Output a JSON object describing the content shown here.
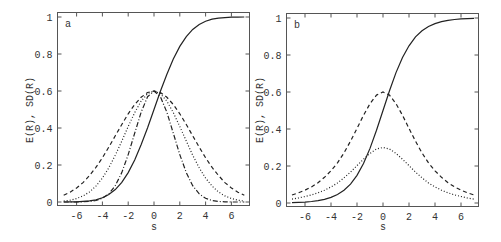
{
  "chart_data": [
    {
      "panel": "a",
      "type": "line",
      "title": "",
      "panel_label": "a",
      "xlabel": "s",
      "ylabel": "E(R), SD(R)",
      "xlim": [
        -7.5,
        7.5
      ],
      "ylim": [
        -0.025,
        1.025
      ],
      "xticks": [
        -6,
        -4,
        -2,
        0,
        2,
        4,
        6
      ],
      "xtick_labels": [
        "-6",
        "-4",
        "-2",
        "0",
        "2",
        "4",
        "6"
      ],
      "yticks": [
        0,
        0.2,
        0.4,
        0.6,
        0.8,
        1
      ],
      "ytick_labels": [
        "0",
        "0.2",
        "0.4",
        "0.6",
        "0.8",
        "1"
      ],
      "grid": false,
      "legend": null,
      "x": [
        -7,
        -6.5,
        -6,
        -5.5,
        -5,
        -4.5,
        -4,
        -3.5,
        -3,
        -2.5,
        -2,
        -1.5,
        -1,
        -0.5,
        0,
        0.5,
        1,
        1.5,
        2,
        2.5,
        3,
        3.5,
        4,
        4.5,
        5,
        5.5,
        6,
        6.5,
        7
      ],
      "series": [
        {
          "name": "E(R)",
          "style": "solid",
          "values": [
            0.0,
            0.001,
            0.001,
            0.003,
            0.006,
            0.012,
            0.023,
            0.04,
            0.067,
            0.106,
            0.159,
            0.227,
            0.309,
            0.401,
            0.5,
            0.599,
            0.691,
            0.773,
            0.841,
            0.894,
            0.933,
            0.96,
            0.977,
            0.988,
            0.994,
            0.997,
            0.999,
            0.999,
            1.0
          ]
        },
        {
          "name": "SD(R) wide",
          "style": "dashed",
          "values": [
            0.036,
            0.053,
            0.076,
            0.105,
            0.143,
            0.187,
            0.239,
            0.297,
            0.358,
            0.419,
            0.477,
            0.527,
            0.566,
            0.592,
            0.6,
            0.592,
            0.566,
            0.527,
            0.477,
            0.419,
            0.358,
            0.297,
            0.239,
            0.187,
            0.143,
            0.105,
            0.076,
            0.053,
            0.036
          ]
        },
        {
          "name": "SD(R) medium",
          "style": "dotted",
          "values": [
            0.005,
            0.01,
            0.019,
            0.033,
            0.054,
            0.086,
            0.129,
            0.185,
            0.253,
            0.329,
            0.408,
            0.483,
            0.545,
            0.586,
            0.6,
            0.586,
            0.545,
            0.483,
            0.408,
            0.329,
            0.253,
            0.185,
            0.129,
            0.086,
            0.054,
            0.033,
            0.019,
            0.01,
            0.005
          ]
        },
        {
          "name": "SD(R) narrow",
          "style": "dashdot",
          "values": [
            0.0,
            0.0,
            0.0,
            0.001,
            0.003,
            0.008,
            0.02,
            0.044,
            0.088,
            0.159,
            0.256,
            0.372,
            0.485,
            0.569,
            0.6,
            0.569,
            0.485,
            0.372,
            0.256,
            0.159,
            0.088,
            0.044,
            0.02,
            0.008,
            0.003,
            0.001,
            0.0,
            0.0,
            0.0
          ]
        }
      ]
    },
    {
      "panel": "b",
      "type": "line",
      "title": "",
      "panel_label": "b",
      "xlabel": "s",
      "ylabel": "E(R), SD(R)",
      "xlim": [
        -7.5,
        7.5
      ],
      "ylim": [
        -0.025,
        1.025
      ],
      "xticks": [
        -6,
        -4,
        -2,
        0,
        2,
        4,
        6
      ],
      "xtick_labels": [
        "-6",
        "-4",
        "-2",
        "0",
        "2",
        "4",
        "6"
      ],
      "yticks": [
        0,
        0.2,
        0.4,
        0.6,
        0.8,
        1
      ],
      "ytick_labels": [
        "0",
        "0.2",
        "0.4",
        "0.6",
        "0.8",
        "1"
      ],
      "grid": false,
      "legend": null,
      "x": [
        -7,
        -6.5,
        -6,
        -5.5,
        -5,
        -4.5,
        -4,
        -3.5,
        -3,
        -2.5,
        -2,
        -1.5,
        -1,
        -0.5,
        0,
        0.5,
        1,
        1.5,
        2,
        2.5,
        3,
        3.5,
        4,
        4.5,
        5,
        5.5,
        6,
        6.5,
        7
      ],
      "series": [
        {
          "name": "E(R)",
          "style": "solid",
          "values": [
            0.002,
            0.003,
            0.005,
            0.008,
            0.013,
            0.02,
            0.03,
            0.046,
            0.069,
            0.102,
            0.15,
            0.213,
            0.295,
            0.393,
            0.5,
            0.607,
            0.705,
            0.787,
            0.85,
            0.898,
            0.931,
            0.954,
            0.97,
            0.98,
            0.987,
            0.992,
            0.995,
            0.997,
            0.998
          ]
        },
        {
          "name": "SD(R) high",
          "style": "dashed",
          "values": [
            0.043,
            0.055,
            0.069,
            0.087,
            0.11,
            0.139,
            0.174,
            0.217,
            0.271,
            0.334,
            0.403,
            0.474,
            0.537,
            0.583,
            0.6,
            0.583,
            0.537,
            0.474,
            0.403,
            0.334,
            0.271,
            0.217,
            0.174,
            0.139,
            0.11,
            0.087,
            0.069,
            0.055,
            0.043
          ]
        },
        {
          "name": "SD(R) low",
          "style": "dotted",
          "values": [
            0.021,
            0.027,
            0.035,
            0.044,
            0.055,
            0.069,
            0.087,
            0.108,
            0.136,
            0.167,
            0.202,
            0.237,
            0.268,
            0.292,
            0.3,
            0.292,
            0.268,
            0.237,
            0.202,
            0.167,
            0.136,
            0.108,
            0.087,
            0.069,
            0.055,
            0.044,
            0.035,
            0.027,
            0.021
          ]
        }
      ]
    }
  ]
}
